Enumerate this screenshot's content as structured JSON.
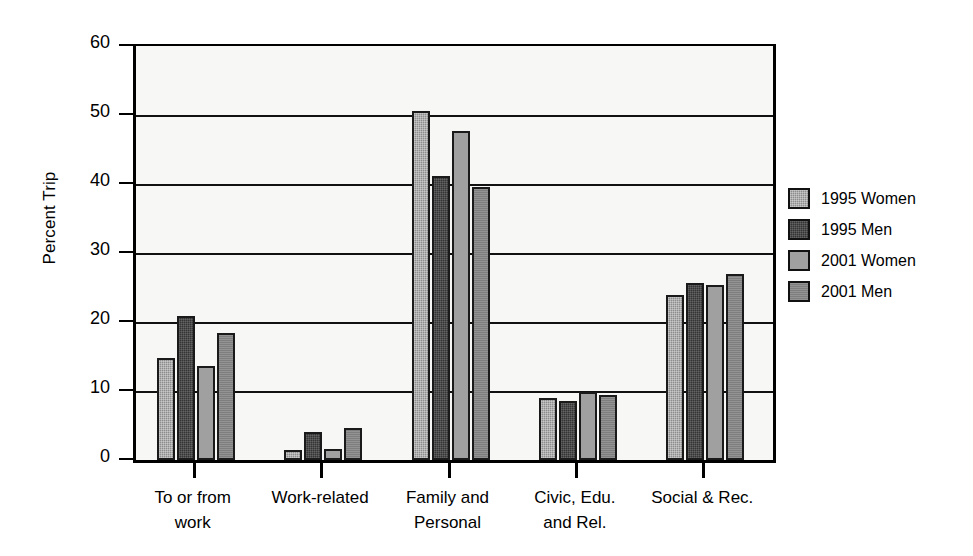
{
  "chart_data": {
    "type": "bar",
    "title": "",
    "xlabel": "",
    "ylabel": "Percent Trip",
    "ylim": [
      0,
      60
    ],
    "yticks": [
      0,
      10,
      20,
      30,
      40,
      50,
      60
    ],
    "grid": true,
    "legend_position": "right",
    "categories": [
      "To or from work",
      "Work-related",
      "Family and Personal",
      "Civic, Edu. and Rel.",
      "Social & Rec."
    ],
    "category_lines": [
      [
        "To or from",
        "work"
      ],
      [
        "Work-related",
        ""
      ],
      [
        "Family and",
        "Personal"
      ],
      [
        "Civic, Edu.",
        "and Rel."
      ],
      [
        "Social & Rec.",
        ""
      ]
    ],
    "series": [
      {
        "name": "1995 Women",
        "color": "#8d8d8d",
        "values": [
          14.8,
          1.5,
          50.6,
          9.0,
          23.9
        ]
      },
      {
        "name": "1995 Men",
        "color": "#343434",
        "values": [
          20.9,
          4.0,
          41.2,
          8.5,
          25.6
        ]
      },
      {
        "name": "2001 Women",
        "color": "#a0a0a0",
        "values": [
          13.6,
          1.6,
          47.7,
          9.8,
          25.4
        ]
      },
      {
        "name": "2001 Men",
        "color": "#7e7e7e",
        "values": [
          18.4,
          4.6,
          39.6,
          9.4,
          26.9
        ]
      }
    ]
  },
  "legend": {
    "items": [
      {
        "label": "1995 Women"
      },
      {
        "label": "1995 Men"
      },
      {
        "label": "2001 Women"
      },
      {
        "label": "2001 Men"
      }
    ]
  },
  "axis": {
    "y_title": "Percent Trip",
    "y_tick_labels": [
      "60",
      "50",
      "40",
      "30",
      "20",
      "10",
      "0"
    ]
  }
}
